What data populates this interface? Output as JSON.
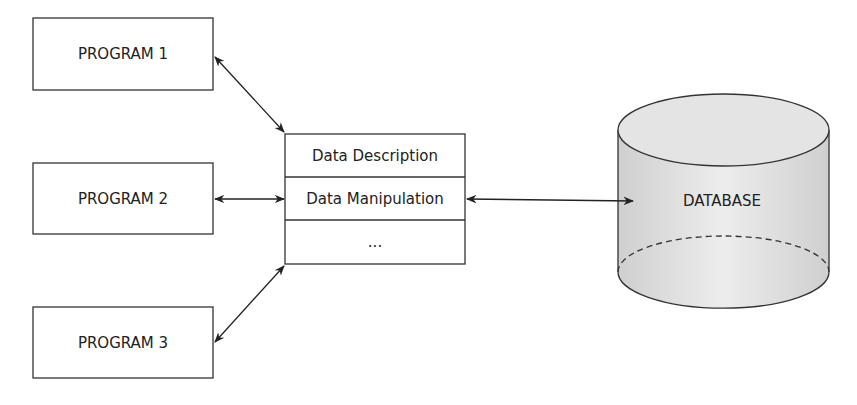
{
  "programs": [
    {
      "label": "PROGRAM 1"
    },
    {
      "label": "PROGRAM 2"
    },
    {
      "label": "PROGRAM 3"
    }
  ],
  "dbms": {
    "rows": [
      "Data Description",
      "Data Manipulation",
      "..."
    ]
  },
  "database": {
    "label": "DATABASE"
  },
  "connections": [
    {
      "from": "PROGRAM 1",
      "to": "DBMS",
      "type": "bidirectional"
    },
    {
      "from": "PROGRAM 2",
      "to": "DBMS",
      "type": "bidirectional"
    },
    {
      "from": "PROGRAM 3",
      "to": "DBMS",
      "type": "bidirectional"
    },
    {
      "from": "DBMS",
      "to": "DATABASE",
      "type": "bidirectional"
    }
  ]
}
